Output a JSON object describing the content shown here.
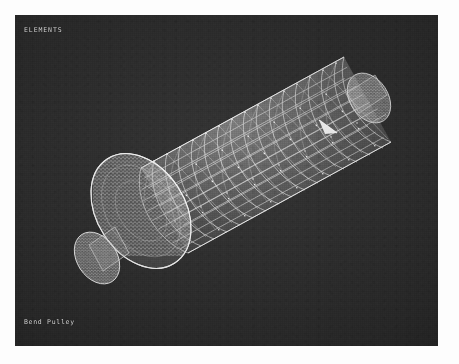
{
  "window": {
    "background_color": "#fdfdfd",
    "viewport_background_color": "#2e2e2e",
    "mesh_color": "#e8e8e8"
  },
  "viewport": {
    "header_label": "ELEMENTS",
    "title_label": "Bend Pulley"
  },
  "model": {
    "name": "bend-pulley-fea-mesh",
    "description": "Triangulated finite-element surface mesh of a cylindrical bend pulley drum with shaft stubs on both ends",
    "element_type": "triangular shell elements",
    "orientation_degrees": -33,
    "drum": {
      "axial_bands": 16,
      "circumferential_divisions": 22
    },
    "marker": {
      "name": "orientation-arrow",
      "color": "#ffffff"
    }
  }
}
